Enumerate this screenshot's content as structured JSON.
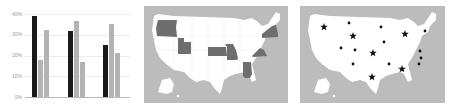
{
  "chart_data": {
    "type": "bar",
    "title": "",
    "xlabel": "",
    "ylabel": "",
    "categories": [
      "",
      "",
      ""
    ],
    "yticks": [
      "0%",
      "10%",
      "20%",
      "30%",
      "40%"
    ],
    "ylim": [
      0,
      40
    ],
    "grid": true,
    "legend": null,
    "series": [
      {
        "name": "Series 1",
        "color": "#1a1a1a",
        "values": [
          39,
          32,
          25
        ]
      },
      {
        "name": "Series 2",
        "color": "#b3b3b3",
        "values": [
          18,
          36.5,
          35
        ]
      },
      {
        "name": "Series 3",
        "color": "#b3b3b3",
        "values": [
          32.5,
          17,
          21
        ]
      }
    ]
  },
  "maps": [
    {
      "name": "Highlighted states map",
      "background": "#bcbcbc",
      "land_color": "#ffffff",
      "highlight_color": "#6e6e6e",
      "highlighted_states": [
        "Oregon",
        "Utah",
        "Kansas",
        "Missouri",
        "Alabama",
        "Virginia",
        "New York"
      ]
    },
    {
      "name": "Marker map",
      "background": "#bcbcbc",
      "land_color": "#ffffff",
      "marker_color": "#111111",
      "star_markers": 6,
      "dot_markers": 11
    }
  ]
}
